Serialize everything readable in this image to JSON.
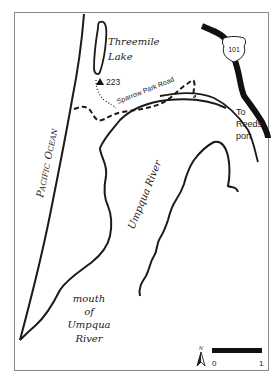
{
  "map": {
    "labels": {
      "lake_line1": "Threemile",
      "lake_line2": "Lake",
      "elevation": "223",
      "road": "Sparrow Park Road",
      "highway": "101",
      "to_line1": "To",
      "to_line2": "Reeds-",
      "to_line3": "port",
      "ocean_p": "P",
      "ocean_acific": "ACIFIC",
      "ocean_o": "O",
      "ocean_cean": "CEAN",
      "river": "Umpqua River",
      "mouth_line1": "mouth",
      "mouth_line2": "of",
      "mouth_line3": "Umpqua",
      "mouth_line4": "River",
      "north": "N",
      "scale_start": "0",
      "scale_end": "1"
    },
    "colors": {
      "ink": "#1a1a1a",
      "frame": "#8a8a8a",
      "background": "#ffffff"
    },
    "icons": {
      "trailhead": "triangle-marker",
      "highway_shield": "us-highway-shield",
      "north_arrow": "north-arrow"
    }
  }
}
